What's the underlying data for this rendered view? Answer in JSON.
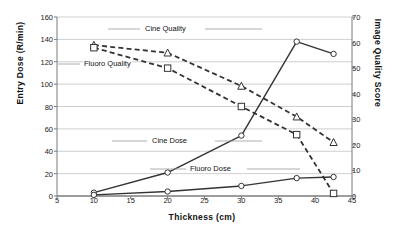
{
  "chart_data": {
    "type": "line",
    "title": "",
    "xlabel": "Thickness (cm)",
    "ylabel": "Entry Dose (R/min)",
    "y2label": "Image Quality Score",
    "xlim": [
      5,
      45
    ],
    "ylim": [
      0,
      160
    ],
    "y2lim": [
      0,
      70
    ],
    "xticks": [
      5,
      10,
      15,
      20,
      25,
      30,
      35,
      40,
      45
    ],
    "yticks": [
      0,
      20,
      40,
      60,
      80,
      100,
      120,
      140,
      160
    ],
    "y2ticks": [
      0,
      10,
      20,
      30,
      40,
      50,
      60,
      70
    ],
    "grid": true,
    "legend_position": "inline-annotations",
    "series": [
      {
        "name": "Cine Quality",
        "axis": "right",
        "style": "dashed",
        "marker": "triangle",
        "x": [
          10,
          20,
          30,
          37.5,
          42.5
        ],
        "y": [
          59,
          56,
          43,
          31,
          21
        ]
      },
      {
        "name": "Fluoro Quality",
        "axis": "right",
        "style": "dashed",
        "marker": "square",
        "x": [
          10,
          20,
          30,
          37.5,
          42.5
        ],
        "y": [
          58,
          50,
          35,
          24,
          1
        ]
      },
      {
        "name": "Cine Dose",
        "axis": "left",
        "style": "solid",
        "marker": "circle",
        "x": [
          10,
          20,
          30,
          37.5,
          42.5
        ],
        "y": [
          3,
          21,
          54,
          138,
          127
        ]
      },
      {
        "name": "Fluoro Dose",
        "axis": "left",
        "style": "solid",
        "marker": "circle",
        "x": [
          10,
          20,
          30,
          37.5,
          42.5
        ],
        "y": [
          1,
          4,
          9,
          16,
          17
        ]
      }
    ],
    "annotations": [
      {
        "text": "Cine Quality",
        "x": 144,
        "y": 29
      },
      {
        "text": "Fluoro Quality",
        "x": 83,
        "y": 64
      },
      {
        "text": "Cine Dose",
        "x": 151,
        "y": 141
      },
      {
        "text": "Fluoro Dose",
        "x": 189,
        "y": 169
      }
    ]
  }
}
